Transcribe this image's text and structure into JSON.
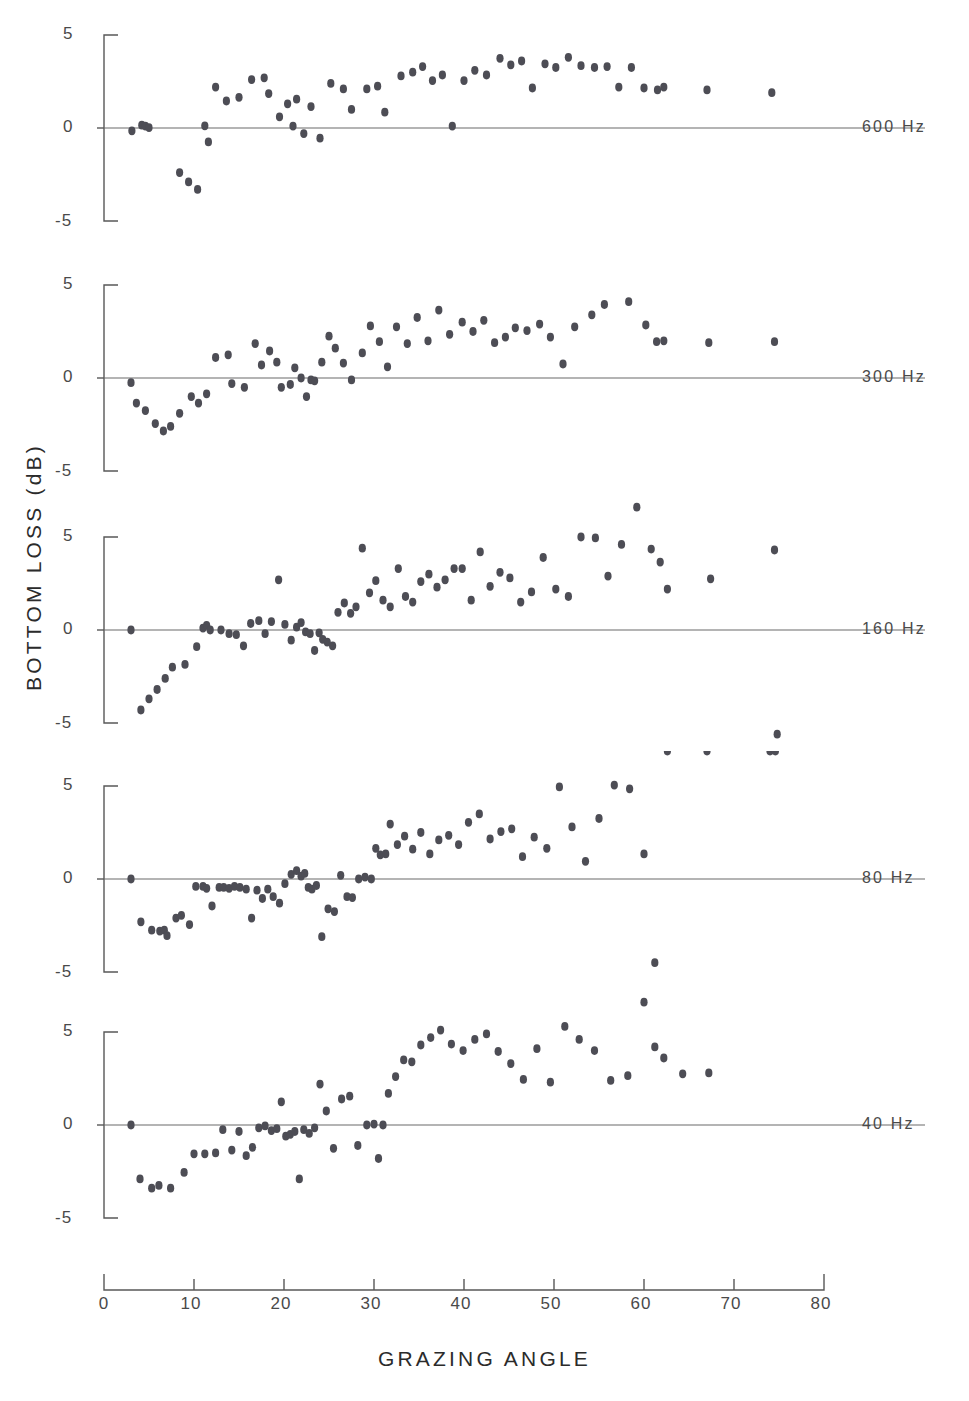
{
  "figure": {
    "ylabel": "BOTTOM  LOSS   (dB)",
    "xlabel": "GRAZING  ANGLE"
  },
  "axis": {
    "x_ticks": [
      "0",
      "10",
      "20",
      "30",
      "40",
      "50",
      "60",
      "70",
      "80"
    ],
    "y_ticks": [
      "5",
      "0",
      "-5"
    ],
    "x_range": [
      0,
      80
    ],
    "y_range": [
      -5,
      5
    ]
  },
  "panels": [
    {
      "label": "600 Hz"
    },
    {
      "label": "300 Hz"
    },
    {
      "label": "160 Hz"
    },
    {
      "label": "80 Hz"
    },
    {
      "label": "40 Hz"
    }
  ],
  "chart_data": [
    {
      "type": "scatter",
      "title": "600 Hz",
      "xlabel": "GRAZING ANGLE",
      "ylabel": "BOTTOM LOSS (dB)",
      "xlim": [
        0,
        80
      ],
      "ylim": [
        -5,
        5
      ],
      "grid": false,
      "legend": "none",
      "series": [
        {
          "name": "600 Hz",
          "x": [
            3.1,
            4.2,
            4.6,
            5.0,
            8.4,
            9.4,
            10.4,
            11.2,
            11.6,
            12.4,
            13.6,
            15.0,
            16.4,
            17.8,
            18.3,
            19.5,
            20.4,
            21.0,
            21.4,
            22.2,
            23.0,
            24.0,
            25.2,
            26.6,
            27.5,
            29.2,
            30.4,
            31.2,
            33.0,
            34.3,
            35.4,
            36.5,
            37.6,
            38.7,
            40.0,
            41.2,
            42.5,
            44.0,
            45.2,
            46.4,
            47.6,
            49.0,
            50.2,
            51.6,
            53.0,
            54.5,
            55.9,
            57.2,
            58.6,
            60.0,
            61.5,
            62.2,
            67.0,
            74.2
          ],
          "y": [
            -0.15,
            0.15,
            0.1,
            0.02,
            -2.4,
            -2.9,
            -3.3,
            0.12,
            -0.75,
            2.2,
            1.45,
            1.65,
            2.6,
            2.7,
            1.85,
            0.6,
            1.3,
            0.1,
            1.55,
            -0.3,
            1.15,
            -0.55,
            2.4,
            2.1,
            1.0,
            2.1,
            2.25,
            0.85,
            2.8,
            3.0,
            3.3,
            2.55,
            2.85,
            0.1,
            2.55,
            3.1,
            2.85,
            3.75,
            3.4,
            3.6,
            2.15,
            3.45,
            3.25,
            3.8,
            3.35,
            3.25,
            3.3,
            2.2,
            3.25,
            2.15,
            2.05,
            2.2,
            2.05,
            1.9
          ]
        }
      ]
    },
    {
      "type": "scatter",
      "title": "300 Hz",
      "xlabel": "GRAZING ANGLE",
      "ylabel": "BOTTOM LOSS (dB)",
      "xlim": [
        0,
        80
      ],
      "ylim": [
        -5,
        5
      ],
      "grid": false,
      "legend": "none",
      "series": [
        {
          "name": "300 Hz",
          "x": [
            3.0,
            3.6,
            4.6,
            5.7,
            6.6,
            7.4,
            8.4,
            9.7,
            10.5,
            11.4,
            12.4,
            13.8,
            14.2,
            15.6,
            16.8,
            17.5,
            18.4,
            19.2,
            19.7,
            20.7,
            21.2,
            21.9,
            22.5,
            23.0,
            23.4,
            24.2,
            25.0,
            25.7,
            26.6,
            27.5,
            28.7,
            29.6,
            30.6,
            31.5,
            32.5,
            33.7,
            34.8,
            36.0,
            37.2,
            38.4,
            39.8,
            41.0,
            42.2,
            43.4,
            44.6,
            45.7,
            47.0,
            48.4,
            49.6,
            51.0,
            52.3,
            54.2,
            55.6,
            58.3,
            60.2,
            61.4,
            62.2,
            67.2,
            74.5
          ],
          "y": [
            -0.25,
            -1.35,
            -1.75,
            -2.45,
            -2.85,
            -2.6,
            -1.9,
            -1.0,
            -1.35,
            -0.85,
            1.1,
            1.25,
            -0.3,
            -0.5,
            1.85,
            0.7,
            1.45,
            0.85,
            -0.5,
            -0.35,
            0.55,
            0.0,
            -1.0,
            -0.1,
            -0.15,
            0.85,
            2.25,
            1.6,
            0.8,
            -0.1,
            1.35,
            2.8,
            1.95,
            0.6,
            2.75,
            1.85,
            3.25,
            2.0,
            3.65,
            2.35,
            3.0,
            2.5,
            3.1,
            1.9,
            2.2,
            2.7,
            2.55,
            2.9,
            2.2,
            0.75,
            2.75,
            3.4,
            3.95,
            4.1,
            2.85,
            1.95,
            2.0,
            1.9,
            1.95
          ]
        }
      ]
    },
    {
      "type": "scatter",
      "title": "160 Hz",
      "xlabel": "GRAZING ANGLE",
      "ylabel": "BOTTOM LOSS (dB)",
      "xlim": [
        0,
        80
      ],
      "ylim": [
        -5,
        5
      ],
      "grid": false,
      "legend": "none",
      "series": [
        {
          "name": "160 Hz",
          "x": [
            3.0,
            4.1,
            5.0,
            5.9,
            6.8,
            7.6,
            9.0,
            10.3,
            11.0,
            11.4,
            11.8,
            13.0,
            13.9,
            14.7,
            15.5,
            16.3,
            17.2,
            17.9,
            18.6,
            19.4,
            20.1,
            20.8,
            21.4,
            21.9,
            22.4,
            22.9,
            23.4,
            23.9,
            24.3,
            24.8,
            25.4,
            26.0,
            26.7,
            27.4,
            28.0,
            28.7,
            29.5,
            30.2,
            31.0,
            31.8,
            32.7,
            33.5,
            34.3,
            35.2,
            36.1,
            37.0,
            37.9,
            38.9,
            39.8,
            40.8,
            41.8,
            42.9,
            44.0,
            45.1,
            46.3,
            47.5,
            48.8,
            50.2,
            51.6,
            53.0,
            54.6,
            56.0,
            57.5,
            59.2,
            60.8,
            61.8,
            62.6,
            67.4,
            74.5,
            74.8
          ],
          "y": [
            0.0,
            -4.3,
            -3.7,
            -3.2,
            -2.6,
            -2.0,
            -1.85,
            -0.9,
            0.1,
            0.25,
            0.0,
            0.0,
            -0.2,
            -0.25,
            -0.85,
            0.35,
            0.5,
            -0.2,
            0.45,
            2.7,
            0.3,
            -0.55,
            0.15,
            0.4,
            -0.1,
            -0.2,
            -1.1,
            -0.15,
            -0.5,
            -0.65,
            -0.85,
            0.95,
            1.45,
            0.9,
            1.25,
            4.4,
            2.0,
            2.65,
            1.6,
            1.25,
            3.3,
            1.8,
            1.5,
            2.6,
            3.0,
            2.3,
            2.7,
            3.3,
            3.3,
            1.6,
            4.2,
            2.35,
            3.1,
            2.8,
            1.5,
            2.05,
            3.9,
            2.2,
            1.8,
            5.0,
            4.95,
            2.9,
            4.6,
            6.6,
            4.35,
            3.65,
            2.2,
            2.75,
            4.3,
            -5.6
          ]
        }
      ]
    },
    {
      "type": "scatter",
      "title": "80 Hz",
      "xlabel": "GRAZING ANGLE",
      "ylabel": "BOTTOM LOSS (dB)",
      "xlim": [
        0,
        80
      ],
      "ylim": [
        -5,
        5
      ],
      "grid": false,
      "legend": "none",
      "series": [
        {
          "name": "80 Hz",
          "x": [
            3.0,
            4.1,
            5.3,
            6.2,
            6.7,
            7.0,
            8.0,
            8.6,
            9.5,
            10.2,
            11.0,
            11.4,
            12.0,
            12.8,
            13.3,
            13.9,
            14.5,
            15.1,
            15.8,
            16.4,
            17.0,
            17.6,
            18.2,
            18.8,
            19.5,
            20.1,
            20.8,
            21.4,
            21.9,
            22.3,
            22.7,
            23.1,
            23.6,
            24.2,
            24.9,
            25.6,
            26.3,
            27.0,
            27.6,
            28.3,
            29.0,
            29.7,
            30.2,
            30.7,
            31.3,
            31.8,
            32.6,
            33.4,
            34.3,
            35.2,
            36.2,
            37.2,
            38.3,
            39.4,
            40.5,
            41.7,
            42.9,
            44.1,
            45.3,
            46.5,
            47.8,
            49.2,
            50.6,
            52.0,
            53.5,
            55.0,
            56.7,
            58.4,
            60.0,
            61.2,
            62.0,
            62.6,
            67.0,
            74.0,
            74.6
          ],
          "y": [
            0.0,
            -2.3,
            -2.75,
            -2.8,
            -2.75,
            -3.05,
            -2.1,
            -1.95,
            -2.45,
            -0.4,
            -0.4,
            -0.5,
            -1.45,
            -0.45,
            -0.45,
            -0.5,
            -0.4,
            -0.45,
            -0.55,
            -2.1,
            -0.6,
            -1.05,
            -0.55,
            -0.95,
            -1.3,
            -0.25,
            0.25,
            0.45,
            0.15,
            0.3,
            -0.45,
            -0.55,
            -0.35,
            -3.1,
            -1.6,
            -1.75,
            0.2,
            -0.95,
            -1.0,
            0.0,
            0.1,
            0.0,
            1.65,
            1.3,
            1.35,
            2.95,
            1.85,
            2.3,
            1.6,
            2.5,
            1.35,
            2.1,
            2.35,
            1.85,
            3.05,
            3.5,
            2.15,
            2.55,
            2.7,
            1.2,
            2.25,
            1.65,
            4.95,
            2.8,
            0.95,
            3.25,
            5.05,
            4.85,
            1.35,
            -4.5,
            -6.8
          ]
        }
      ]
    },
    {
      "type": "scatter",
      "title": "40 Hz",
      "xlabel": "GRAZING ANGLE",
      "ylabel": "BOTTOM LOSS (dB)",
      "xlim": [
        0,
        80
      ],
      "ylim": [
        -5,
        5
      ],
      "grid": false,
      "legend": "none",
      "series": [
        {
          "name": "40 Hz",
          "x": [
            3.0,
            4.0,
            5.3,
            6.1,
            7.4,
            8.9,
            10.0,
            11.2,
            12.4,
            13.2,
            14.2,
            15.0,
            15.8,
            16.5,
            17.2,
            17.9,
            18.6,
            19.2,
            19.7,
            20.2,
            20.7,
            21.2,
            21.7,
            22.2,
            22.8,
            23.4,
            24.0,
            24.7,
            25.5,
            26.4,
            27.3,
            28.2,
            29.2,
            30.0,
            30.5,
            31.0,
            31.6,
            32.4,
            33.3,
            34.2,
            35.2,
            36.3,
            37.4,
            38.6,
            39.9,
            41.2,
            42.5,
            43.8,
            45.2,
            46.6,
            48.1,
            49.6,
            51.2,
            52.8,
            54.5,
            56.3,
            58.2,
            60.0,
            61.2,
            62.2,
            64.3,
            67.2
          ],
          "y": [
            0.0,
            -2.9,
            -3.4,
            -3.25,
            -3.4,
            -2.55,
            -1.55,
            -1.55,
            -1.5,
            -0.25,
            -1.35,
            -0.35,
            -1.65,
            -1.2,
            -0.15,
            -0.05,
            -0.3,
            -0.2,
            1.25,
            -0.6,
            -0.5,
            -0.35,
            -2.9,
            -0.25,
            -0.45,
            -0.15,
            2.2,
            0.75,
            -1.25,
            1.4,
            1.55,
            -1.1,
            0.0,
            0.05,
            -1.8,
            0.0,
            1.7,
            2.6,
            3.5,
            3.4,
            4.3,
            4.7,
            5.1,
            4.35,
            4.0,
            4.6,
            4.9,
            3.95,
            3.3,
            2.45,
            4.1,
            2.3,
            5.3,
            4.6,
            4.0,
            2.4,
            2.65,
            6.6,
            4.2,
            3.6,
            2.75,
            2.8
          ]
        }
      ]
    }
  ]
}
